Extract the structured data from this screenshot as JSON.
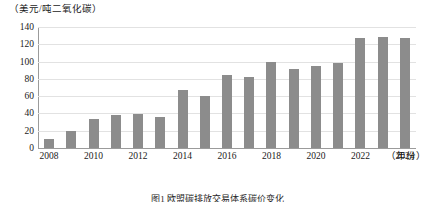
{
  "chart_data": {
    "type": "bar",
    "title": "",
    "caption": "图1 欧盟碳排放交易体系碳价变化",
    "xlabel": "（年份）",
    "ylabel": "（美元/吨二氧化碳）",
    "categories": [
      2008,
      2009,
      2010,
      2011,
      2012,
      2013,
      2014,
      2015,
      2016,
      2017,
      2018,
      2019,
      2020,
      2021,
      2022,
      2023,
      2024
    ],
    "values": [
      11,
      20,
      34,
      38,
      39,
      36,
      67,
      60,
      84,
      82,
      100,
      92,
      95,
      98,
      127,
      128,
      127
    ],
    "x_tick_labels": [
      "2008",
      "2010",
      "2012",
      "2014",
      "2016",
      "2018",
      "2020",
      "2022",
      "2024"
    ],
    "y_tick_labels": [
      "0",
      "20",
      "40",
      "60",
      "80",
      "100",
      "120",
      "140"
    ],
    "y_ticks": [
      0,
      20,
      40,
      60,
      80,
      100,
      120,
      140
    ],
    "ylim": [
      0,
      140
    ],
    "grid": true,
    "legend": "none",
    "bar_color": "#8c8c8c",
    "grid_color": "#e2e2e2",
    "axis_color": "#9b9b9b"
  }
}
